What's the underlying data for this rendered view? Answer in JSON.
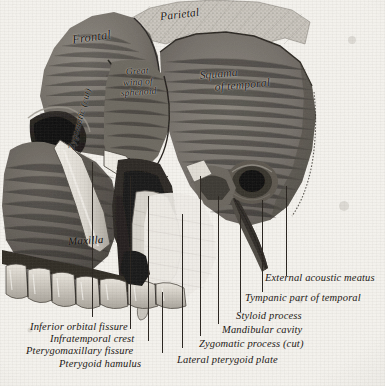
{
  "figure": {
    "style": "grayscale anatomical engraving",
    "background_color": "#f5f3ee",
    "ink_color": "#1b1714"
  },
  "bone_labels": [
    {
      "id": "frontal",
      "text": "Frontal"
    },
    {
      "id": "parietal",
      "text": "Parietal"
    },
    {
      "id": "sphenoid_l1",
      "text": "Great"
    },
    {
      "id": "sphenoid_l2",
      "text": "wing of"
    },
    {
      "id": "sphenoid_l3",
      "text": "sphenoid"
    },
    {
      "id": "squama_l1",
      "text": "Squama"
    },
    {
      "id": "squama_l2",
      "text": "of temporal"
    },
    {
      "id": "zygomatic_arch",
      "text": "Zygomatic (cut)"
    },
    {
      "id": "maxilla",
      "text": "Maxilla"
    }
  ],
  "caption_labels_left": [
    {
      "id": "inferior-orbital-fissure",
      "text": "Inferior orbital fissure"
    },
    {
      "id": "infratemporal-crest",
      "text": "Infratemporal crest"
    },
    {
      "id": "pterygomaxillary-fissure",
      "text": "Pterygomaxillary fissure"
    },
    {
      "id": "pterygoid-hamulus",
      "text": "Pterygoid hamulus"
    }
  ],
  "caption_labels_right": [
    {
      "id": "external-acoustic-meatus",
      "text": "External acoustic meatus"
    },
    {
      "id": "tympanic-part-of-temporal",
      "text": "Tympanic part of temporal"
    },
    {
      "id": "styloid-process",
      "text": "Styloid process"
    },
    {
      "id": "mandibular-cavity",
      "text": "Mandibular cavity"
    },
    {
      "id": "zygomatic-process-cut",
      "text": "Zygomatic process (cut)"
    },
    {
      "id": "lateral-pterygoid-plate",
      "text": "Lateral pterygoid plate"
    }
  ]
}
